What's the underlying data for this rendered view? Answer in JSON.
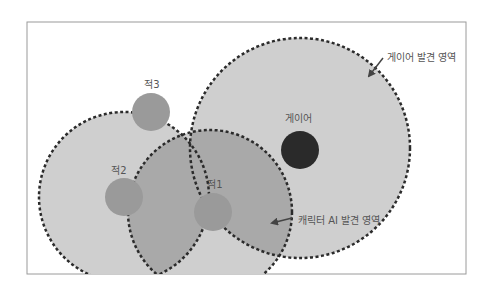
{
  "diagram": {
    "frame": {
      "x": 27,
      "y": 22,
      "width": 439,
      "height": 252,
      "stroke": "#9a9a9a"
    },
    "colors": {
      "area_fill": "#cfcfcf",
      "area_stroke": "#2b2b2b",
      "overlap_fill": "#a9a9a9",
      "enemy_fill": "#9a9a9a",
      "player_fill": "#2a2a2a",
      "label_color": "#555555"
    },
    "areas": [
      {
        "id": "enemy2-area",
        "cx": 124,
        "cy": 197,
        "r": 85
      },
      {
        "id": "enemy1-area",
        "cx": 210,
        "cy": 212,
        "r": 82
      },
      {
        "id": "player-area",
        "cx": 300,
        "cy": 148,
        "r": 110
      }
    ],
    "enemies": [
      {
        "id": "enemy1",
        "label": "적1",
        "cx": 213,
        "cy": 212,
        "r": 19,
        "label_x": 215,
        "label_y": 188
      },
      {
        "id": "enemy2",
        "label": "적2",
        "cx": 124,
        "cy": 197,
        "r": 19,
        "label_x": 119,
        "label_y": 174
      },
      {
        "id": "enemy3",
        "label": "적3",
        "cx": 151,
        "cy": 112,
        "r": 19,
        "label_x": 152,
        "label_y": 88
      }
    ],
    "player": {
      "label": "게이어",
      "cx": 300,
      "cy": 150,
      "r": 19,
      "label_x": 298,
      "label_y": 122
    },
    "callouts": [
      {
        "id": "player-area-callout",
        "text": "게이어 발견 영역",
        "text_x": 387,
        "text_y": 58,
        "arrow_from": [
          383,
          58
        ],
        "arrow_to": [
          369,
          76
        ]
      },
      {
        "id": "ai-area-callout",
        "text": "캐릭터 AI 발견 영역",
        "text_x": 298,
        "text_y": 221,
        "arrow_from": [
          292,
          218
        ],
        "arrow_to": [
          272,
          223
        ]
      }
    ]
  }
}
